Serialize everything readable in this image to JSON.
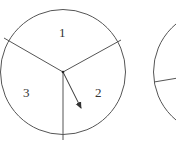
{
  "diagram": {
    "spinner1": {
      "sectors": [
        {
          "label": "1"
        },
        {
          "label": "2"
        },
        {
          "label": "3"
        }
      ],
      "pointer": "arrow pointing into sector 2"
    },
    "spinner2": {
      "partially_visible": true
    },
    "colors": {
      "stroke": "#555555",
      "text": "#333333",
      "background": "#ffffff"
    }
  }
}
